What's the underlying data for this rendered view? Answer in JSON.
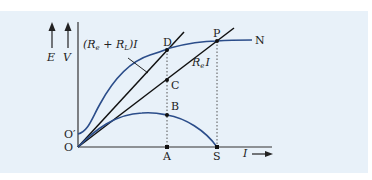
{
  "diagram": {
    "type": "generator characteristic curves",
    "axes": {
      "y_labels": [
        "E",
        "V"
      ],
      "x_label": "I",
      "origin": "O",
      "e_intercept": "O′"
    },
    "lines": {
      "total_resistance_line": "(R_e + R_L)I",
      "external_resistance_line": "R_e I"
    },
    "lines_display": {
      "total_prefix": "(R",
      "total_sub_e": "e",
      "total_plus": " + R",
      "total_sub_L": "L",
      "total_suffix": ")I",
      "ext_R": "R",
      "ext_sub_e": "e",
      "ext_I": "I"
    },
    "points": {
      "D": "D",
      "C": "C",
      "B": "B",
      "A": "A",
      "P": "P",
      "S": "S",
      "N": "N",
      "O": "O",
      "O_prime": "O′"
    },
    "colors": {
      "background": "#e8f1f9",
      "curve": "#2b4d8a",
      "line": "#111111",
      "axis": "#333333"
    }
  }
}
